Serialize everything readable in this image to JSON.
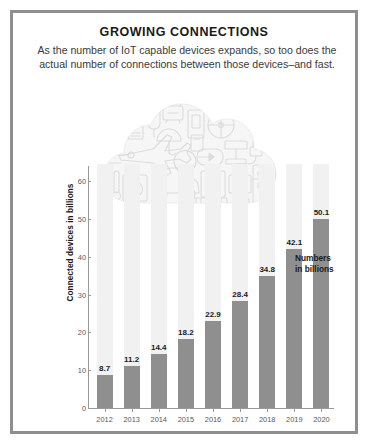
{
  "header": {
    "title": "GROWING CONNECTIONS",
    "subtitle": "As the number of IoT capable devices expands, so too does the actual number of connections between those devices–and fast."
  },
  "annotation": {
    "line1": "Numbers",
    "line2": "in billions"
  },
  "illustration": {
    "name": "iot-cloud-illustration",
    "caption": "cloud filled with line-art icons of IoT devices",
    "icons": [
      "airplane-icon",
      "car-icon",
      "washing-machine-icon",
      "light-bulb-icon",
      "refrigerator-icon",
      "alarm-clock-icon",
      "thermostat-icon",
      "power-plug-icon",
      "weighing-scale-icon",
      "speaker-icon",
      "lamp-icon",
      "coffee-maker-icon",
      "fan-icon",
      "tablet-icon",
      "keyboard-icon",
      "door-lock-icon",
      "thermometer-icon",
      "camera-icon",
      "watch-icon",
      "radiator-icon"
    ],
    "stroke_color": "#dcdcdc",
    "fill_color": "#f5f5f5"
  },
  "chart_data": {
    "type": "bar",
    "title": "GROWING CONNECTIONS",
    "subtitle": "As the number of IoT capable devices expands, so too does the actual number of connections between those devices–and fast.",
    "xlabel": "",
    "ylabel": "Connected devices in billions",
    "categories": [
      "2012",
      "2013",
      "2014",
      "2015",
      "2016",
      "2017",
      "2018",
      "2019",
      "2020"
    ],
    "values": [
      8.7,
      11.2,
      14.4,
      18.2,
      22.9,
      28.4,
      34.8,
      42.1,
      50.1
    ],
    "value_labels": [
      "8.7",
      "11.2",
      "14.4",
      "18.2",
      "22.9",
      "28.4",
      "34.8",
      "42.1",
      "50.1"
    ],
    "ylim": [
      0,
      64
    ],
    "yticks": [
      0,
      10,
      20,
      30,
      40,
      50,
      60
    ],
    "ytick_labels": [
      "0",
      "10",
      "20",
      "30",
      "40",
      "50",
      "60"
    ],
    "grid": false,
    "legend": false,
    "annotation": "Numbers in billions",
    "bar_color": "#8f8f8f",
    "track_color": "#f1f1f1",
    "axis_color": "#9a9a9a",
    "text_color": "#1a1a1a"
  }
}
